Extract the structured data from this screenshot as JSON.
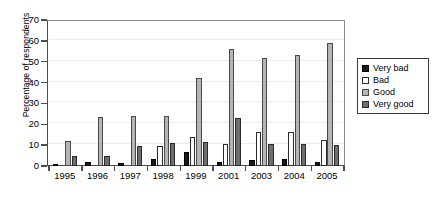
{
  "chart_data": {
    "type": "bar",
    "title": "",
    "subtitle": "",
    "xlabel": "",
    "ylabel": "Percentage of respondents",
    "categories": [
      "1995",
      "1996",
      "1997",
      "1998",
      "1999",
      "2001",
      "2003",
      "2004",
      "2005"
    ],
    "series": [
      {
        "name": "Very bad",
        "color": "#1a1a1a",
        "values": [
          1,
          2,
          1.5,
          3.5,
          6.5,
          2,
          3,
          3.5,
          2
        ]
      },
      {
        "name": "Bad",
        "color": "#fbfbfb",
        "values": [
          0,
          0,
          0,
          9.5,
          14,
          10.5,
          16.5,
          16.5,
          12.5
        ]
      },
      {
        "name": "Good",
        "color": "#b5b5b5",
        "values": [
          12,
          23.5,
          24,
          24,
          42,
          56,
          52,
          53,
          59
        ]
      },
      {
        "name": "Very good",
        "color": "#6e6e6e",
        "values": [
          5,
          5,
          9.5,
          11,
          11.5,
          23,
          10.5,
          10.5,
          10
        ]
      }
    ],
    "ylim": [
      0,
      70
    ],
    "yticks": [
      0,
      10,
      20,
      30,
      40,
      50,
      60,
      70
    ],
    "ytick_labels": [
      "0",
      "10",
      "20",
      "30",
      "40",
      "50",
      "60",
      "70"
    ],
    "grid": true,
    "grid_axis": "y",
    "legend": [
      "Very bad",
      "Bad",
      "Good",
      "Very good"
    ],
    "legend_position": "right",
    "legend_border": true
  }
}
